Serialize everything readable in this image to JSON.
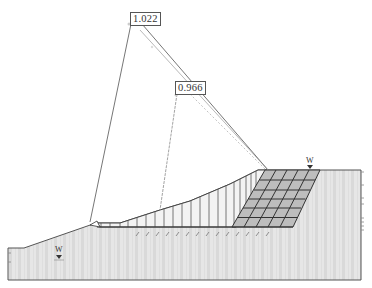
{
  "diagram": {
    "type": "slope-stability-analysis",
    "colors": {
      "soil_fill": "#e4e4e4",
      "soil_stripe": "#d6d6d6",
      "outline": "#555555",
      "slice_fill": "#f2f2f2",
      "reinforcement_fill": "#b8b8b8",
      "grid_line": "#444444",
      "circle_line_primary": "#666666",
      "circle_line_secondary": "#aaaaaa"
    },
    "slip_surfaces": [
      {
        "id": "surface-1",
        "factor_of_safety": "1.022",
        "center_label_pos": [
          130,
          12
        ]
      },
      {
        "id": "surface-2",
        "factor_of_safety": "0.966",
        "center_label_pos": [
          175,
          81
        ]
      }
    ],
    "water_table_markers": [
      {
        "label": "W",
        "pos": [
          58,
          252
        ]
      },
      {
        "label": "W",
        "pos": [
          309,
          160
        ]
      }
    ],
    "geometry": {
      "ground_surface": [
        [
          8,
          248
        ],
        [
          24,
          248
        ],
        [
          96,
          223
        ],
        [
          120,
          223
        ],
        [
          160,
          210
        ],
        [
          190,
          201
        ],
        [
          230,
          184
        ],
        [
          258,
          170
        ],
        [
          361,
          170
        ]
      ],
      "bottom_y": 280,
      "right_x": 361,
      "left_x": 8,
      "slip_base_y": 227
    }
  }
}
